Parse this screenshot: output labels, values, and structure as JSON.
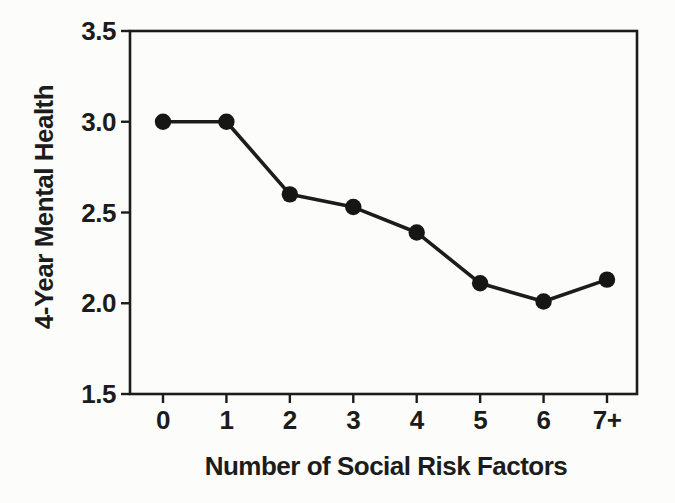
{
  "figure": {
    "background": "#fcfcfb",
    "ink": "#1c1c1c"
  },
  "chart_data": {
    "type": "line",
    "title": "",
    "xlabel": "Number of Social Risk Factors",
    "ylabel": "4-Year Mental Health",
    "categories": [
      "0",
      "1",
      "2",
      "3",
      "4",
      "5",
      "6",
      "7+"
    ],
    "series": [
      {
        "name": "4-Year Mental Health",
        "values": [
          3.0,
          3.0,
          2.6,
          2.53,
          2.39,
          2.11,
          2.01,
          2.13
        ]
      }
    ],
    "ylim": [
      1.5,
      3.5
    ],
    "yticks": [
      1.5,
      2.0,
      2.5,
      3.0,
      3.5
    ],
    "ytick_format_decimals": 1,
    "grid": false,
    "legend": "none",
    "marker": "filled-circle",
    "marker_color": "#161616",
    "line_color": "#1c1c1c"
  }
}
